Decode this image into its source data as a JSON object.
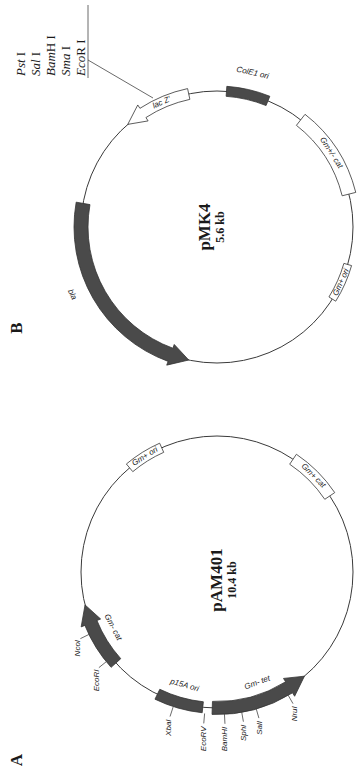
{
  "panels": [
    {
      "letter": "A",
      "letter_pos": [
        22,
        760
      ],
      "plasmid": {
        "name": "pAM401",
        "size": "10.4 kb",
        "center": [
          217,
          572
        ],
        "radius": 136,
        "features": [
          {
            "label": "Gm- tet",
            "type": "arrow",
            "style": "dark",
            "start": 92,
            "end": 50,
            "width": 13,
            "label_r": 118,
            "label_angle": 70,
            "color": "#4a4a4a"
          },
          {
            "label": "p15A ori",
            "type": "box",
            "style": "dark",
            "start": 116,
            "end": 96,
            "width": 11,
            "label_r": 118,
            "label_angle": 106,
            "color": "#4a4a4a"
          },
          {
            "label": "Gm- cat",
            "type": "arrow",
            "style": "dark",
            "start": 138,
            "end": 166,
            "width": 13,
            "label_r": 118,
            "label_angle": 152,
            "color": "#4a4a4a"
          },
          {
            "label": "Gm+ ori",
            "type": "box",
            "style": "light",
            "start": 230,
            "end": 246,
            "width": 10,
            "label_r": 136,
            "label_angle": 238
          },
          {
            "label": "Gm+ cat",
            "type": "box",
            "style": "light",
            "start": 304,
            "end": 326,
            "width": 12,
            "label_r": 136,
            "label_angle": 315
          }
        ],
        "sites": [
          {
            "label": "XbaI",
            "angle": 108
          },
          {
            "label": "EcoRV",
            "angle": 95
          },
          {
            "label": "BamHI",
            "angle": 87
          },
          {
            "label": "SphI",
            "angle": 80
          },
          {
            "label": "SalI",
            "angle": 74
          },
          {
            "label": "NruI",
            "angle": 60
          },
          {
            "label": "EcoRI",
            "angle": 141
          },
          {
            "label": "NcoI",
            "angle": 154
          }
        ]
      }
    },
    {
      "letter": "B",
      "letter_pos": [
        22,
        328
      ],
      "plasmid": {
        "name": "pMK4",
        "size": "5.6 kb",
        "center": [
          217,
          227
        ],
        "radius": 136,
        "features": [
          {
            "label": "bla",
            "type": "arrow",
            "style": "dark",
            "start": 190,
            "end": 102,
            "width": 14,
            "label_r": 160,
            "label_angle": 155,
            "color": "#4a4a4a"
          },
          {
            "label": "lac Z'",
            "type": "arrow",
            "style": "light",
            "start": 258,
            "end": 229,
            "width": 11,
            "label_r": 136,
            "label_angle": 246
          },
          {
            "label": "ColE1 ori",
            "type": "box",
            "style": "dark",
            "start": 274,
            "end": 292,
            "width": 10,
            "label_r": 158,
            "label_angle": 283,
            "color": "#4a4a4a"
          },
          {
            "label": "Gm+/- cat",
            "type": "box",
            "style": "light",
            "start": 308,
            "end": 346,
            "width": 14,
            "label_r": 136,
            "label_angle": 327
          },
          {
            "label": "Gm+ ori",
            "type": "box",
            "style": "light",
            "start": 16,
            "end": 32,
            "width": 8,
            "label_r": 136,
            "label_angle": 24
          }
        ],
        "mcs": {
          "sites": [
            "EcoR I",
            "Sma I",
            "BamH I",
            "Sal I",
            "Pst I"
          ],
          "italic_parts": [
            "Eco",
            "Sma",
            "Bam",
            "Sal",
            "Pst"
          ],
          "roman_parts": [
            "R I",
            " I",
            "H I",
            " I",
            " I"
          ],
          "anchor_angle": 244
        }
      }
    }
  ]
}
